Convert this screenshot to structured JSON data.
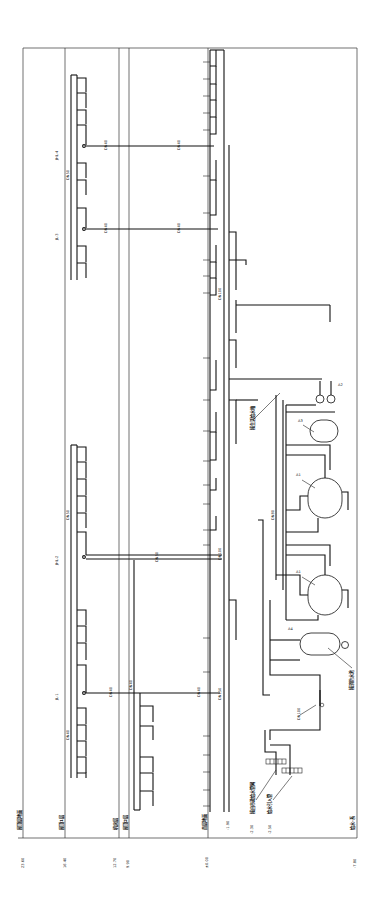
{
  "diagram": {
    "orientation": "rotated-90-ccw",
    "colors": {
      "line": "#111111",
      "background": "#ffffff",
      "frame": "#333333"
    },
    "elevations": [
      {
        "id": "e1",
        "value": "23.60",
        "label": "屋顶层地面",
        "x": 23
      },
      {
        "id": "e2",
        "value": "16.40",
        "label": "屋顶1层",
        "x": 65
      },
      {
        "id": "e3",
        "value": "12.70",
        "label": "机房层",
        "x": 119
      },
      {
        "id": "e4",
        "value": "9.90",
        "label": "屋顶2层",
        "x": 129
      },
      {
        "id": "e5",
        "value": "±0.00",
        "label": "首层地面",
        "x": 208
      },
      {
        "id": "e6",
        "value": "-1.90",
        "label": "",
        "x": 227
      },
      {
        "id": "e7",
        "value": "-2.30",
        "label": "给水引入管",
        "x": 252
      },
      {
        "id": "e8",
        "value": "-2.50",
        "label": "给水引入管",
        "x": 270
      },
      {
        "id": "e9",
        "value": "-7.80",
        "label": "地下一层",
        "x": 355
      }
    ],
    "branch_risers": [
      {
        "id": "JL-4",
        "label": "JHL-4"
      },
      {
        "id": "JL-3",
        "label": "JL-3"
      },
      {
        "id": "JL-2",
        "label": "JHL-2"
      },
      {
        "id": "JL-1",
        "label": "JL-1"
      },
      {
        "id": "JL-0",
        "label": "JL-0"
      }
    ],
    "pipe_sizes": [
      "DN15",
      "DN20",
      "DN25",
      "DN32",
      "DN40",
      "DN50",
      "DN65",
      "DN80",
      "DN100",
      "DN150"
    ],
    "horizontal_pipe_labels": [
      "DN40",
      "DN40",
      "DN40",
      "DN40",
      "DN50",
      "DN50",
      "DN40",
      "DN40"
    ],
    "equipment": [
      {
        "id": "A1a",
        "tag": "A1",
        "type": "pressure-tank"
      },
      {
        "id": "A1b",
        "tag": "A1",
        "type": "pressure-tank"
      },
      {
        "id": "A3",
        "tag": "A3",
        "type": "tank"
      },
      {
        "id": "A4",
        "tag": "A4",
        "type": "tank"
      },
      {
        "id": "A2",
        "tag": "A2",
        "type": "pump-pair"
      }
    ],
    "notes": [
      {
        "id": "n1",
        "text": "接自市政给水管网"
      },
      {
        "id": "n2",
        "text": "给水引入管"
      },
      {
        "id": "n3",
        "text": "接生活给水箱"
      },
      {
        "id": "n4",
        "text": "接消防水池"
      }
    ],
    "footer_label": "给水-系"
  }
}
